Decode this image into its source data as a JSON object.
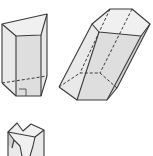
{
  "figure": {
    "colors": {
      "edge": "#3a3a3a",
      "face_top": "#f0f0f0",
      "face_light": "#e9e9e9",
      "face_mid": "#dedede",
      "face_dark": "#d2d2d2",
      "background": "#ffffff"
    },
    "shapes": [
      {
        "name": "right-quadrilateral-prism",
        "base_sides": 4,
        "type": "right prism",
        "right_angle_marker": true
      },
      {
        "name": "oblique-hexagonal-prism",
        "base_sides": 6,
        "type": "oblique prism"
      },
      {
        "name": "y-shaped-prism",
        "base_sides": 8,
        "type": "prism (partially cropped)"
      }
    ]
  }
}
